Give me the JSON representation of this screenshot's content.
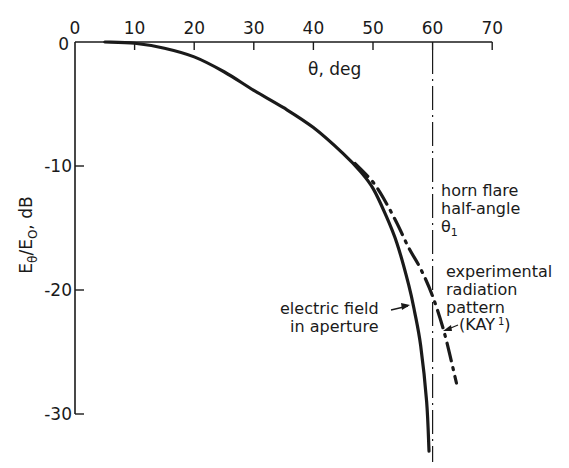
{
  "chart_data": {
    "type": "line",
    "title": "",
    "xlabel": "θ, deg",
    "ylabel": "Eθ/E0, dB",
    "xlim": [
      0,
      70
    ],
    "ylim": [
      -30,
      0
    ],
    "x_ticks": [
      0,
      10,
      20,
      30,
      40,
      50,
      60,
      70
    ],
    "y_ticks": [
      0,
      -10,
      -20,
      -30
    ],
    "x_tick_labels": [
      "0",
      "10",
      "20",
      "30",
      "40",
      "50",
      "60",
      "70"
    ],
    "y_tick_labels": [
      "0",
      "-10",
      "-20",
      "-30"
    ],
    "x_axis_position": "top",
    "grid": false,
    "series": [
      {
        "name": "electric field in aperture",
        "style": "solid",
        "x": [
          5,
          10,
          15,
          20,
          25,
          30,
          35,
          40,
          45,
          48,
          50,
          52,
          54,
          56,
          57,
          58,
          59,
          59.4
        ],
        "values": [
          0,
          -0.1,
          -0.5,
          -1.2,
          -2.4,
          -3.9,
          -5.3,
          -6.9,
          -9.0,
          -10.5,
          -11.8,
          -13.8,
          -16.2,
          -19.6,
          -21.8,
          -24.5,
          -29.0,
          -33.0
        ]
      },
      {
        "name": "experimental radiation pattern (KAY 1)",
        "style": "dash-dot",
        "x": [
          47,
          50,
          52,
          54,
          56,
          58,
          60,
          62,
          64
        ],
        "values": [
          -9.8,
          -11.3,
          -12.8,
          -14.6,
          -16.6,
          -18.3,
          -20.5,
          -23.5,
          -27.5
        ]
      }
    ],
    "reference_lines": [
      {
        "x": 60,
        "style": "dash-dot-vertical",
        "label": "horn flare half-angle θ1"
      }
    ],
    "annotations": [
      {
        "text": "electric field in aperture",
        "points_to": "electric field in aperture"
      },
      {
        "text": "experimental radiation pattern (KAY 1)",
        "points_to": "experimental radiation pattern (KAY 1)"
      },
      {
        "text": "horn flare half-angle θ1",
        "points_to": "reference line at 60°"
      }
    ]
  },
  "labels": {
    "x_axis_title": "θ, deg",
    "y_axis_title_main": "E",
    "y_axis_title_sub1": "θ",
    "y_axis_title_mid": "/E",
    "y_axis_title_sub2": "O",
    "y_axis_title_end": ", dB",
    "origin": "0",
    "annot_horn": [
      "horn flare",
      "half-angle",
      "θ"
    ],
    "annot_horn_sub": "1",
    "annot_exp": [
      "experimental",
      "radiation",
      "pattern",
      "(KAY"
    ],
    "annot_exp_sup": "1",
    "annot_exp_close": ")",
    "annot_elec": [
      "electric field",
      "in aperture"
    ]
  },
  "colors": {
    "ink": "#1a1a1a",
    "background": "#ffffff"
  }
}
